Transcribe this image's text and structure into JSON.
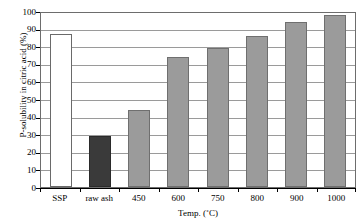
{
  "chart_data": {
    "type": "bar",
    "title": "",
    "xlabel": "Temp. (˚C)",
    "ylabel": "P-solubility in citric acid (%)",
    "categories": [
      "SSP",
      "raw ash",
      "450",
      "600",
      "750",
      "800",
      "900",
      "1000"
    ],
    "values": [
      87,
      29,
      44,
      74,
      79,
      86,
      94,
      97.5
    ],
    "series": [
      {
        "name": "P-solubility in citric acid",
        "values": [
          87,
          29,
          44,
          74,
          79,
          86,
          94,
          97.5
        ]
      }
    ],
    "bar_styles": [
      "white",
      "dark",
      "grey",
      "grey",
      "grey",
      "grey",
      "grey",
      "grey"
    ],
    "ylim": [
      0,
      100
    ],
    "ytick_values": [
      0,
      10,
      20,
      30,
      40,
      50,
      60,
      70,
      80,
      90,
      100
    ],
    "ytick_labels": [
      "0",
      "10",
      "20",
      "30",
      "40",
      "50",
      "60",
      "70",
      "80",
      "90",
      "100"
    ],
    "grid": true,
    "grid_axis": "y",
    "legend": false,
    "legend_position": "none",
    "colors": {
      "bar_white": "#ffffff",
      "bar_dark": "#3a3a3a",
      "bar_grey": "#9b9b9b",
      "gridline": "#9a9a9a",
      "axis": "#000000",
      "plot_border": "#6d6d6d",
      "background": "#ffffff",
      "text": "#000000"
    }
  }
}
